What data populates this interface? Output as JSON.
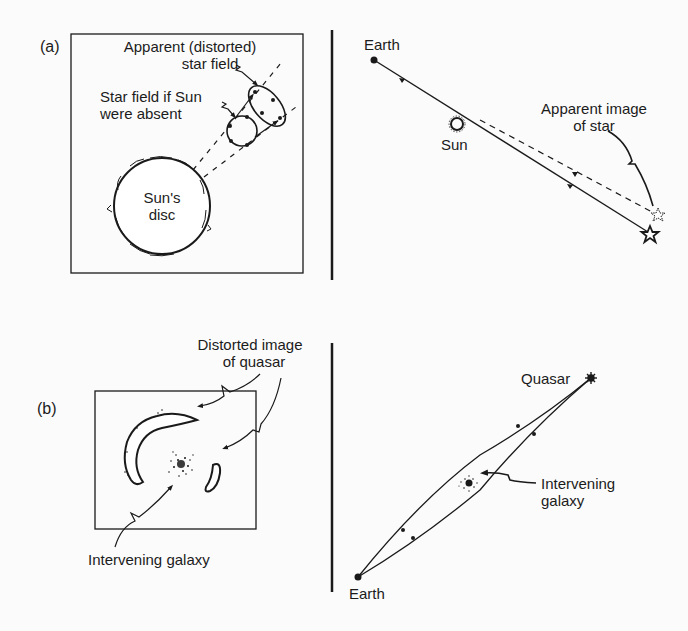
{
  "figure": {
    "panel_a": {
      "tag": "(a)",
      "left": {
        "apparent_field_label_line1": "Apparent (distorted)",
        "apparent_field_label_line2": "star field",
        "absent_field_label_line1": "Star field if Sun",
        "absent_field_label_line2": "were absent",
        "sun_disc_label_line1": "Sun's",
        "sun_disc_label_line2": "disc"
      },
      "right": {
        "earth_label": "Earth",
        "sun_label": "Sun",
        "apparent_image_label_line1": "Apparent image",
        "apparent_image_label_line2": "of star"
      }
    },
    "panel_b": {
      "tag": "(b)",
      "left": {
        "distorted_label_line1": "Distorted image",
        "distorted_label_line2": "of quasar",
        "galaxy_label": "Intervening galaxy"
      },
      "right": {
        "quasar_label": "Quasar",
        "galaxy_label_line1": "Intervening",
        "galaxy_label_line2": "galaxy",
        "earth_label": "Earth"
      }
    },
    "colors": {
      "ink": "#1a1a1a",
      "background": "#fbfbfb"
    }
  }
}
